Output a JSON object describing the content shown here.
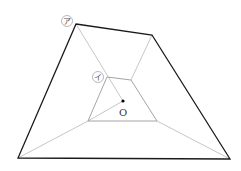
{
  "diagram": {
    "labels": {
      "outer": "ア",
      "inner": "イ",
      "center": "O"
    },
    "colors": {
      "outer_stroke": "#1a1a1a",
      "inner_stroke": "#9a9a9a",
      "connector_stroke": "#b8b8b8",
      "point": "#000000"
    },
    "outer_quad": [
      [
        76,
        24
      ],
      [
        152,
        35
      ],
      [
        230,
        159
      ],
      [
        18,
        158
      ]
    ],
    "inner_quad": [
      [
        107,
        77
      ],
      [
        131,
        80
      ],
      [
        157,
        121
      ],
      [
        88,
        121
      ]
    ],
    "center_point": [
      123,
      101
    ]
  }
}
